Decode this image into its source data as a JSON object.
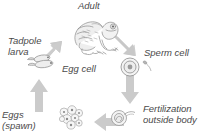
{
  "diagram": {
    "kind": "cycle-diagram",
    "background_color": "#ffffff",
    "arrow_color": "#cfcfcf",
    "sketch_color": "#8a8a8a",
    "text_color": "#4a4a4a",
    "stages": [
      {
        "id": "adult",
        "label": "Adult",
        "illustration": "frog-sketch",
        "position": "top"
      },
      {
        "id": "sperm-cell",
        "label": "Sperm cell",
        "illustration": "egg-and-sperm-sketch",
        "position": "right-upper"
      },
      {
        "id": "fertilization",
        "label": "Fertilization\noutside body",
        "label_line1": "Fertilization",
        "label_line2": "outside body",
        "illustration": "fertilized-egg-sketch",
        "position": "right-lower"
      },
      {
        "id": "eggs-spawn",
        "label": "Eggs\n(spawn)",
        "label_line1": "Eggs",
        "label_line2": "(spawn)",
        "illustration": "egg-cluster-sketch",
        "position": "bottom-left"
      },
      {
        "id": "tadpole-larva",
        "label": "Tadpole\nlarva",
        "label_line1": "Tadpole",
        "label_line2": "larva",
        "illustration": "tadpole-sketch",
        "position": "left"
      }
    ],
    "center_label": "Egg cell",
    "arrows": [
      {
        "id": "arrow-tadpole-to-adult",
        "direction": "up-right"
      },
      {
        "id": "arrow-adult-to-sperm",
        "direction": "down-right"
      },
      {
        "id": "arrow-sperm-to-fertilization",
        "direction": "down"
      },
      {
        "id": "arrow-fertilization-to-eggs",
        "direction": "left"
      },
      {
        "id": "arrow-eggs-to-tadpole",
        "direction": "up"
      }
    ]
  }
}
